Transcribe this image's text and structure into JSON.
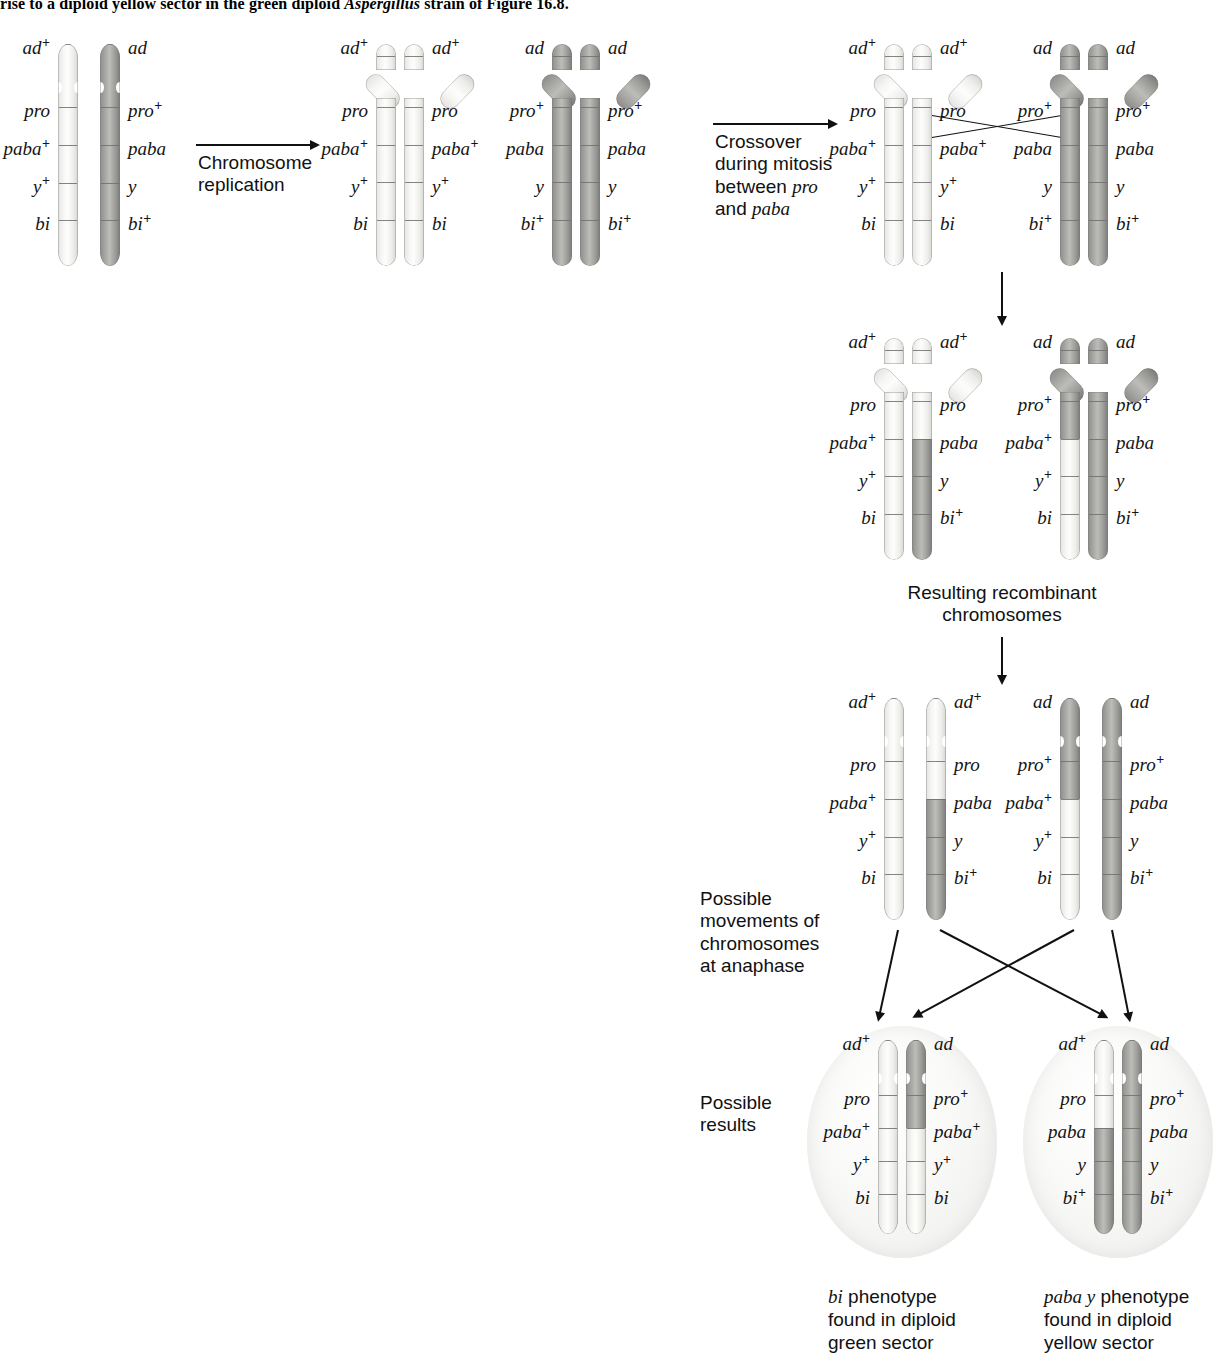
{
  "caption": {
    "top_text_before": "rise to a diploid yellow sector in the green diploid ",
    "top_text_italic": "Aspergillus",
    "top_text_after": " strain of Figure 16.8."
  },
  "genes": {
    "ad": "ad",
    "ad_plus": "ad",
    "pro": "pro",
    "paba": "paba",
    "y": "y",
    "bi": "bi",
    "plus": "+"
  },
  "steps": [
    {
      "name": "chromosome-replication",
      "label": "Chromosome\nreplication"
    },
    {
      "name": "crossover-during-mitosis",
      "label_line1": "Crossover",
      "label_line2": "during mitosis",
      "label_line3_pre": "between ",
      "label_line3_it": "pro",
      "label_line4_pre": "and ",
      "label_line4_it": "paba"
    },
    {
      "name": "resulting-recombinant-chromosomes",
      "label": "Resulting recombinant\nchromosomes"
    },
    {
      "name": "possible-movements",
      "label": "Possible\nmovements of\nchromosomes\nat anaphase"
    },
    {
      "name": "possible-results",
      "label": "Possible\nresults"
    }
  ],
  "stage1": {
    "name": "parental-chromosomes",
    "chromosomes": [
      {
        "shade": "light",
        "side": "left",
        "alleles": [
          "ad+",
          "pro",
          "paba+",
          "y+",
          "bi"
        ]
      },
      {
        "shade": "dark",
        "side": "right",
        "alleles": [
          "ad",
          "pro+",
          "paba",
          "y",
          "bi+"
        ]
      }
    ]
  },
  "stage2": {
    "name": "replicated-chromosomes",
    "chromosomes": [
      {
        "shade": "light",
        "left_alleles": [
          "ad+",
          "pro",
          "paba+",
          "y+",
          "bi"
        ],
        "right_alleles": [
          "ad+",
          "pro",
          "paba+",
          "y+",
          "bi"
        ]
      },
      {
        "shade": "dark",
        "left_alleles": [
          "ad",
          "pro+",
          "paba",
          "y",
          "bi+"
        ],
        "right_alleles": [
          "ad",
          "pro+",
          "paba",
          "y",
          "bi+"
        ]
      }
    ]
  },
  "stage3": {
    "name": "crossover-stage",
    "chromosomes": [
      {
        "shade": "light",
        "left_alleles": [
          "ad+",
          "pro",
          "paba+",
          "y+",
          "bi"
        ],
        "right_alleles": [
          "ad+",
          "pro",
          "paba+",
          "y+",
          "bi"
        ]
      },
      {
        "shade": "dark",
        "left_alleles": [
          "ad",
          "pro+",
          "paba",
          "y",
          "bi+"
        ],
        "right_alleles": [
          "ad",
          "pro+",
          "paba",
          "y",
          "bi+"
        ]
      }
    ],
    "crossover_between": [
      "pro",
      "paba"
    ]
  },
  "stage4": {
    "name": "recombinant-chromosomes",
    "chromosomes": [
      {
        "shade": "light",
        "left_alleles": [
          "ad+",
          "pro",
          "paba+",
          "y+",
          "bi"
        ],
        "right_alleles": [
          "ad+",
          "pro",
          "paba",
          "y",
          "bi+"
        ],
        "right_recombinant": true
      },
      {
        "shade": "dark",
        "left_alleles": [
          "ad",
          "pro+",
          "paba+",
          "y+",
          "bi"
        ],
        "right_alleles": [
          "ad",
          "pro+",
          "paba",
          "y",
          "bi+"
        ],
        "left_recombinant": true
      }
    ]
  },
  "stage5": {
    "name": "separated-chromosomes",
    "chromosomes": [
      {
        "shade": "light",
        "alleles": [
          "ad+",
          "pro",
          "paba+",
          "y+",
          "bi"
        ]
      },
      {
        "shade": "light-dark",
        "alleles": [
          "ad+",
          "pro",
          "paba",
          "y",
          "bi+"
        ]
      },
      {
        "shade": "dark-light",
        "alleles": [
          "ad",
          "pro+",
          "paba+",
          "y+",
          "bi"
        ]
      },
      {
        "shade": "dark",
        "alleles": [
          "ad",
          "pro+",
          "paba",
          "y",
          "bi+"
        ]
      }
    ]
  },
  "results": [
    {
      "name": "result-cell-green",
      "chromosomes": [
        {
          "shade": "light",
          "alleles": [
            "ad+",
            "pro",
            "paba+",
            "y+",
            "bi"
          ]
        },
        {
          "shade": "dark-light",
          "alleles": [
            "ad",
            "pro+",
            "paba+",
            "y+",
            "bi"
          ]
        }
      ],
      "caption_it": "bi",
      "caption_rest": " phenotype\nfound in diploid\ngreen sector"
    },
    {
      "name": "result-cell-yellow",
      "chromosomes": [
        {
          "shade": "light-dark",
          "alleles": [
            "ad+",
            "pro",
            "paba",
            "y",
            "bi+"
          ]
        },
        {
          "shade": "dark",
          "alleles": [
            "ad",
            "pro+",
            "paba",
            "y",
            "bi+"
          ]
        }
      ],
      "caption_it": "paba y",
      "caption_rest": " phenotype\nfound in diploid\nyellow sector"
    }
  ],
  "colors": {
    "light_chromatid": "#f4f4f2",
    "dark_chromatid": "#a6a6a3",
    "band": "#6e6e6e",
    "cell_fill": "#ececea",
    "ink": "#111111"
  }
}
